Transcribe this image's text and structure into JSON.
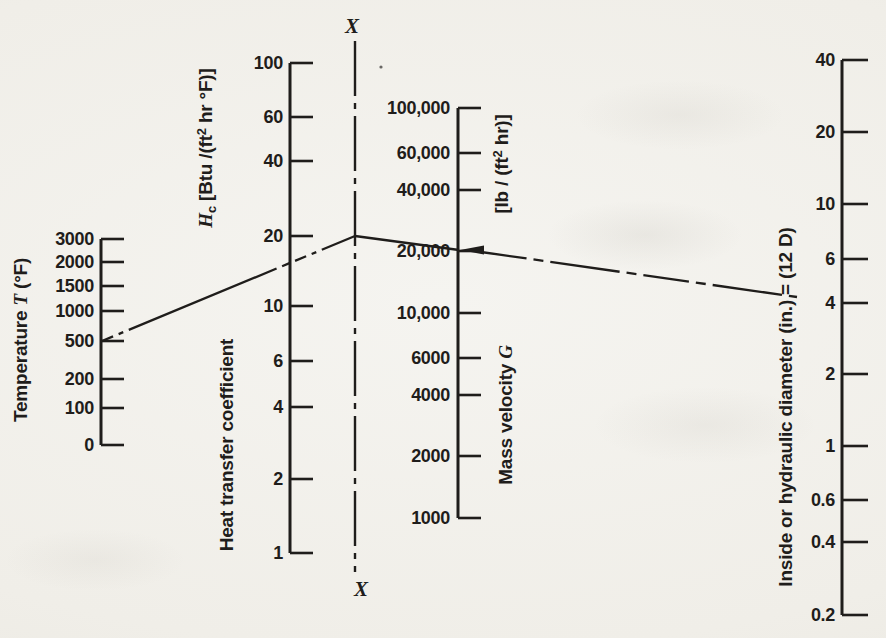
{
  "figure": {
    "type": "nomogram alignment chart (scanned textbook figure)",
    "ink_color": "#1f1d1b",
    "paper_color": "#f1efe9"
  },
  "chart_data": {
    "type": "nomogram",
    "scales": [
      {
        "id": "temperature",
        "title_segments": [
          {
            "t": "Temperature "
          },
          {
            "t": "T",
            "italic": true
          },
          {
            "t": " (°F)"
          }
        ],
        "tick_labels": [
          "3000",
          "2000",
          "1500",
          "1000",
          "500",
          "200",
          "100",
          "0"
        ],
        "tick_values": [
          3000,
          2000,
          1500,
          1000,
          500,
          200,
          100,
          0
        ],
        "scale": "custom",
        "labels_side": "left"
      },
      {
        "id": "hc",
        "unit_segments": [
          {
            "t": "H",
            "italic": true
          },
          {
            "t": "c",
            "sub": true
          },
          {
            "t": " [Btu /(ft"
          },
          {
            "t": "2",
            "sup": true
          },
          {
            "t": " hr °F)]"
          }
        ],
        "name": "Heat transfer coefficient",
        "tick_labels": [
          "100",
          "60",
          "40",
          "20",
          "10",
          "6",
          "4",
          "2",
          "1"
        ],
        "tick_values": [
          100,
          60,
          40,
          20,
          10,
          6,
          4,
          2,
          1
        ],
        "scale": "log",
        "labels_side": "left"
      },
      {
        "id": "g",
        "unit_segments": [
          {
            "t": "[lb / (ft"
          },
          {
            "t": "2",
            "sup": true
          },
          {
            "t": " hr)]"
          }
        ],
        "name_segments": [
          {
            "t": "Mass velocity "
          },
          {
            "t": "G",
            "italic": true
          }
        ],
        "tick_labels": [
          "100,000",
          "60,000",
          "40,000",
          "20,000",
          "10,000",
          "6000",
          "4000",
          "2000",
          "1000"
        ],
        "tick_values": [
          100000,
          60000,
          40000,
          20000,
          10000,
          6000,
          4000,
          2000,
          1000
        ],
        "scale": "log",
        "labels_side": "left"
      },
      {
        "id": "d",
        "title": "Inside or hydraulic diameter (in.) = (12 D)",
        "tick_labels": [
          "40",
          "20",
          "10",
          "6",
          "4",
          "2",
          "1",
          "0.6",
          "0.4",
          "0.2"
        ],
        "tick_values": [
          40,
          20,
          10,
          6,
          4,
          2,
          1,
          0.6,
          0.4,
          0.2
        ],
        "scale": "log",
        "labels_side": "left"
      }
    ],
    "reference_line": {
      "top_label": "X",
      "bottom_label": "X"
    },
    "example_solution": {
      "temperature": 500,
      "mass_velocity": 20000,
      "diameter": 4,
      "arrow_marks": "mass velocity value 20,000",
      "line_style": "dash-dot index lines through pivot on X-X"
    }
  }
}
